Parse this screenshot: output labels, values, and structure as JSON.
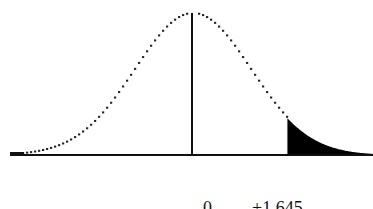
{
  "chart_data": {
    "type": "area",
    "title": "",
    "distribution": "standard normal",
    "mean": 0,
    "critical_value": 1.645,
    "shaded_region": "right tail, z > 1.645",
    "xlabel": "",
    "ylabel": "",
    "x_tick_labels": [
      "0",
      "1.645"
    ],
    "grid": false,
    "legend": null,
    "curve_style": "dotted",
    "fill_color": "#000000"
  },
  "labels": {
    "mean_label": "0",
    "critical_label": "+1.645"
  }
}
